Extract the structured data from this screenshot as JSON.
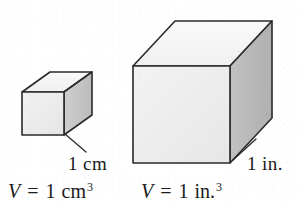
{
  "figure": {
    "background_color": "#ffffff",
    "edge_color": "#2b2b2b",
    "colors": {
      "front_face": "#eeeeee",
      "top_face": "#f6f6f6",
      "side_face": "#b9b9b9",
      "edge": "#2b2b2b",
      "text": "#1a1a1a"
    },
    "objects": [
      {
        "id": "small-cube",
        "name": "cubic-centimeter-cube",
        "dimension_label": "1 cm",
        "volume_label_parts": {
          "variable": "V",
          "equals": "=",
          "value": "1",
          "unit": "cm",
          "exponent": "3"
        },
        "volume_label": "V = 1 cm3",
        "front_face_fill": "#eeeeee",
        "top_face_fill": "#f6f6f6",
        "side_face_fill": "#c4c4c4"
      },
      {
        "id": "large-cube",
        "name": "cubic-inch-cube",
        "dimension_label": "1 in.",
        "volume_label_parts": {
          "variable": "V",
          "equals": "=",
          "value": "1",
          "unit": "in.",
          "exponent": "3"
        },
        "volume_label": "V = 1 in.3",
        "front_face_fill": "#efefef",
        "top_face_fill": "#f6f6f6",
        "side_face_fill": "#b9b9b9"
      }
    ]
  }
}
